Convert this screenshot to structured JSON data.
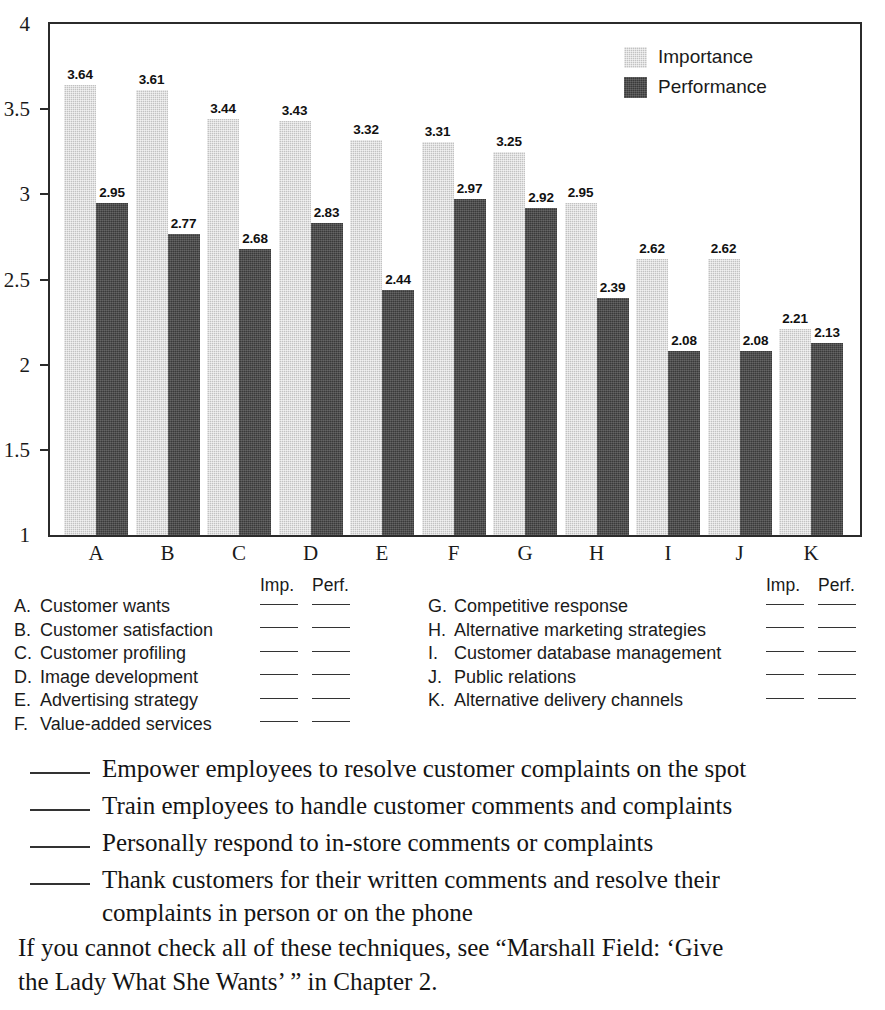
{
  "chart_data": {
    "type": "bar",
    "title": "",
    "subtitle": "",
    "xlabel": "",
    "ylabel": "",
    "ylim": [
      1,
      4
    ],
    "yticks": [
      "4",
      "3.5",
      "3",
      "2.5",
      "2",
      "1.5",
      "1"
    ],
    "ytick_values": [
      4,
      3.5,
      3,
      2.5,
      2,
      1.5,
      1
    ],
    "grid": false,
    "legend_position": "top-right",
    "categories": [
      "A",
      "B",
      "C",
      "D",
      "E",
      "F",
      "G",
      "H",
      "I",
      "J",
      "K"
    ],
    "series": [
      {
        "name": "Importance",
        "color": "#c2c2c2",
        "values": [
          3.64,
          3.61,
          3.44,
          3.43,
          3.32,
          3.31,
          3.25,
          2.95,
          2.62,
          2.62,
          2.21
        ],
        "labels": [
          "3.64",
          "3.61",
          "3.44",
          "3.43",
          "3.32",
          "3.31",
          "3.25",
          "2.95",
          "2.62",
          "2.62",
          "2.21"
        ]
      },
      {
        "name": "Performance",
        "color": "#3a3a3a",
        "values": [
          2.95,
          2.77,
          2.68,
          2.83,
          2.44,
          2.97,
          2.92,
          2.39,
          2.08,
          2.08,
          2.13
        ],
        "labels": [
          "2.95",
          "2.77",
          "2.68",
          "2.83",
          "2.44",
          "2.97",
          "2.92",
          "2.39",
          "2.08",
          "2.08",
          "2.13"
        ]
      }
    ]
  },
  "legend": {
    "items": [
      {
        "label": "Importance",
        "swatch": "imp"
      },
      {
        "label": "Performance",
        "swatch": "perf"
      }
    ]
  },
  "key": {
    "column_headers": {
      "imp": "Imp.",
      "perf": "Perf."
    },
    "left_items": [
      {
        "letter": "A.",
        "text": "Customer wants"
      },
      {
        "letter": "B.",
        "text": "Customer satisfaction"
      },
      {
        "letter": "C.",
        "text": "Customer profiling"
      },
      {
        "letter": "D.",
        "text": "Image development"
      },
      {
        "letter": "E.",
        "text": "Advertising strategy"
      },
      {
        "letter": "F.",
        "text": "Value-added services"
      }
    ],
    "right_items": [
      {
        "letter": "G.",
        "text": "Competitive response"
      },
      {
        "letter": "H.",
        "text": "Alternative marketing strategies"
      },
      {
        "letter": "I.",
        "text": "Customer database management"
      },
      {
        "letter": "J.",
        "text": "Public relations"
      },
      {
        "letter": "K.",
        "text": "Alternative delivery channels"
      }
    ]
  },
  "checklist": {
    "items": [
      {
        "text": "Empower employees to resolve customer complaints on the spot",
        "continuation": ""
      },
      {
        "text": "Train employees to handle customer comments and complaints",
        "continuation": ""
      },
      {
        "text": "Personally respond to in-store comments or complaints",
        "continuation": ""
      },
      {
        "text": "Thank customers for their written comments and resolve their",
        "continuation": "complaints in person or on the phone"
      }
    ]
  },
  "closing": {
    "line1": "If you cannot check all of these techniques, see “Marshall Field: ‘Give",
    "line2": "the Lady What She Wants’ ” in Chapter 2."
  }
}
